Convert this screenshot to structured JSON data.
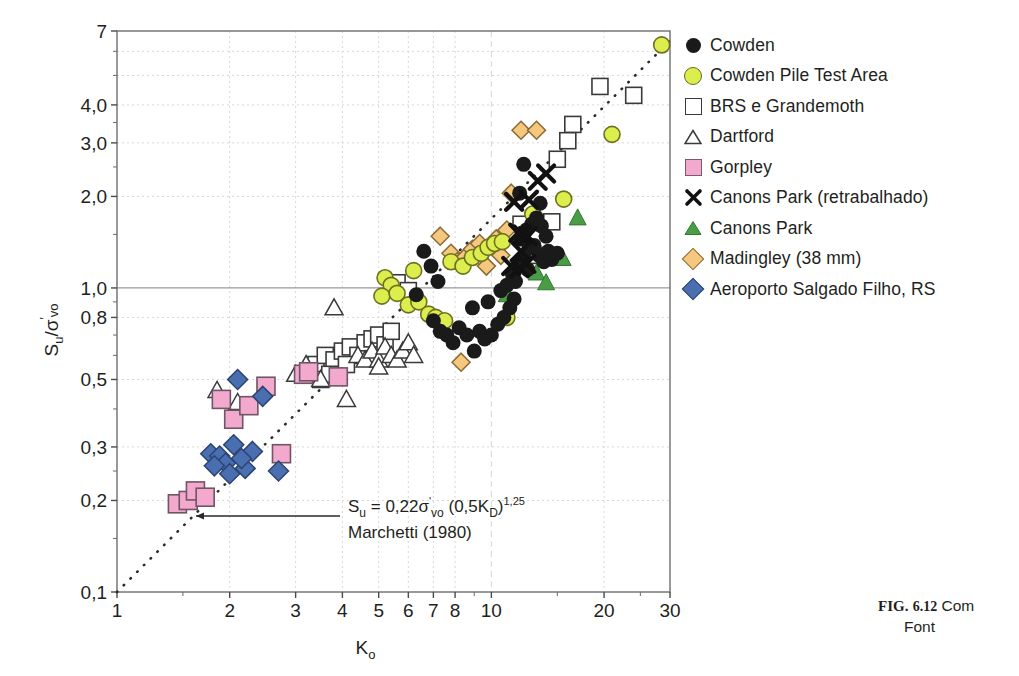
{
  "figure": {
    "caption_line1": "FIG. 6.12 Com",
    "caption_line2": "Font",
    "caption_label": "FIG.",
    "caption_number": "6.12"
  },
  "axes": {
    "ylabel": "S",
    "ylabel_sub": "u",
    "ylabel_den": "σ",
    "ylabel_den_sub": "vo",
    "ylabel_full": "Su/σ'vo",
    "xlabel": "K",
    "xlabel_sub": "o",
    "xlabel_full": "Ko",
    "x_ticks": [
      "1",
      "2",
      "3",
      "4",
      "5",
      "6",
      "7",
      "8",
      "10",
      "20",
      "30"
    ],
    "x_tick_values": [
      1,
      2,
      3,
      4,
      5,
      6,
      7,
      8,
      10,
      20,
      30
    ],
    "y_ticks": [
      "0,1",
      "0,2",
      "0,3",
      "0,5",
      "0,8",
      "1,0",
      "2,0",
      "3,0",
      "4,0",
      "7"
    ],
    "y_tick_values": [
      0.1,
      0.2,
      0.3,
      0.5,
      0.8,
      1.0,
      2.0,
      3.0,
      4.0,
      7.0
    ],
    "xlim": [
      1,
      30
    ],
    "ylim": [
      0.1,
      7
    ],
    "xscale": "log",
    "yscale": "log",
    "grid": true
  },
  "annotation": {
    "equation": "Su = 0,22σ'vo (0,5KD)1,25",
    "eq_s": "S",
    "eq_s_sub": "u",
    "eq_mid": " = 0,22σ",
    "eq_prime": "'",
    "eq_vo": "vo",
    "eq_paren": " (0,5K",
    "eq_kd": "D",
    "eq_close": ")",
    "eq_exp": "1,25",
    "reference": "Marchetti (1980)"
  },
  "legend": {
    "items": [
      {
        "label": "Cowden",
        "marker": "circle-black",
        "color": "#1a1a1a"
      },
      {
        "label": "Cowden Pile Test Area",
        "marker": "circle-yellow",
        "color": "#dced4e"
      },
      {
        "label": "BRS e Grandemoth",
        "marker": "square-white",
        "color": "#ffffff"
      },
      {
        "label": "Dartford",
        "marker": "triangle-white",
        "color": "#ffffff"
      },
      {
        "label": "Gorpley",
        "marker": "square-pink",
        "color": "#f3a9cd"
      },
      {
        "label": "Canons Park (retrabalhado)",
        "marker": "x-black",
        "color": "#111111"
      },
      {
        "label": "Canons Park",
        "marker": "triangle-green",
        "color": "#4a9c46"
      },
      {
        "label": "Madingley (38 mm)",
        "marker": "diamond-orange",
        "color": "#f6c87f"
      },
      {
        "label": "Aeroporto Salgado Filho, RS",
        "marker": "diamond-blue",
        "color": "#4a6fb0"
      }
    ]
  },
  "chart_data": {
    "type": "scatter",
    "title": "",
    "xlabel": "Ko",
    "ylabel": "Su/σ'vo",
    "xscale": "log",
    "yscale": "log",
    "xlim": [
      1,
      30
    ],
    "ylim": [
      0.1,
      7
    ],
    "grid": true,
    "legend_position": "right",
    "trendline": {
      "label": "Su = 0,22σ'vo (0,5KD)1,25",
      "style": "dotted",
      "points": [
        [
          1,
          0.1
        ],
        [
          30,
          6.5
        ]
      ]
    },
    "reference_line_y": 1.0,
    "series": [
      {
        "name": "Cowden",
        "marker": "circle-black",
        "color": "#1a1a1a",
        "points": [
          [
            6.6,
            1.32
          ],
          [
            6.9,
            1.18
          ],
          [
            7.2,
            1.05
          ],
          [
            6.3,
            0.95
          ],
          [
            7.0,
            0.78
          ],
          [
            7.3,
            0.72
          ],
          [
            7.6,
            0.7
          ],
          [
            7.9,
            0.66
          ],
          [
            8.2,
            0.74
          ],
          [
            8.6,
            0.7
          ],
          [
            9.0,
            0.62
          ],
          [
            9.3,
            0.72
          ],
          [
            9.6,
            0.68
          ],
          [
            10.0,
            0.7
          ],
          [
            10.4,
            0.76
          ],
          [
            10.8,
            0.8
          ],
          [
            11.2,
            0.86
          ],
          [
            11.5,
            0.92
          ],
          [
            11.0,
            1.02
          ],
          [
            11.4,
            1.1
          ],
          [
            11.8,
            1.18
          ],
          [
            12.2,
            1.26
          ],
          [
            12.6,
            1.35
          ],
          [
            12.0,
            1.45
          ],
          [
            12.4,
            1.55
          ],
          [
            12.8,
            1.62
          ],
          [
            13.2,
            1.7
          ],
          [
            13.6,
            1.6
          ],
          [
            14.0,
            1.48
          ],
          [
            13.0,
            1.38
          ],
          [
            13.4,
            1.28
          ],
          [
            14.2,
            1.32
          ],
          [
            13.8,
            1.22
          ],
          [
            12.5,
            1.15
          ],
          [
            11.9,
            2.05
          ],
          [
            12.2,
            2.55
          ],
          [
            13.5,
            1.9
          ],
          [
            14.5,
            1.24
          ],
          [
            15.0,
            1.3
          ],
          [
            11.6,
            1.05
          ],
          [
            10.6,
            0.98
          ],
          [
            9.8,
            0.9
          ],
          [
            8.9,
            0.86
          ]
        ]
      },
      {
        "name": "Cowden Pile Test Area",
        "marker": "circle-yellow",
        "color": "#dced4e",
        "points": [
          [
            5.2,
            1.08
          ],
          [
            5.4,
            1.02
          ],
          [
            5.1,
            0.94
          ],
          [
            5.6,
            0.96
          ],
          [
            6.0,
            0.88
          ],
          [
            6.4,
            0.9
          ],
          [
            6.8,
            0.82
          ],
          [
            7.1,
            0.8
          ],
          [
            7.5,
            0.78
          ],
          [
            6.2,
            1.14
          ],
          [
            7.8,
            1.22
          ],
          [
            8.4,
            1.18
          ],
          [
            8.9,
            1.26
          ],
          [
            9.4,
            1.3
          ],
          [
            9.8,
            1.36
          ],
          [
            10.2,
            1.4
          ],
          [
            11.0,
            0.8
          ],
          [
            12.9,
            1.75
          ],
          [
            15.6,
            1.96
          ],
          [
            21.0,
            3.2
          ],
          [
            28.5,
            6.3
          ],
          [
            10.7,
            1.42
          ]
        ]
      },
      {
        "name": "BRS e Grandemoth",
        "marker": "square-white",
        "color": "#ffffff",
        "points": [
          [
            3.4,
            0.56
          ],
          [
            3.6,
            0.6
          ],
          [
            3.8,
            0.58
          ],
          [
            4.0,
            0.62
          ],
          [
            4.2,
            0.64
          ],
          [
            4.4,
            0.6
          ],
          [
            4.6,
            0.66
          ],
          [
            4.8,
            0.68
          ],
          [
            5.0,
            0.7
          ],
          [
            5.2,
            0.65
          ],
          [
            5.4,
            0.72
          ],
          [
            3.5,
            0.5
          ],
          [
            3.7,
            0.52
          ],
          [
            4.1,
            0.56
          ],
          [
            5.6,
            1.04
          ],
          [
            6.0,
            0.98
          ],
          [
            12.0,
            1.62
          ],
          [
            13.0,
            1.28
          ],
          [
            14.5,
            1.65
          ],
          [
            15.0,
            2.65
          ],
          [
            16.5,
            3.45
          ],
          [
            16.0,
            3.05
          ],
          [
            19.5,
            4.6
          ],
          [
            24.0,
            4.3
          ]
        ]
      },
      {
        "name": "Dartford",
        "marker": "triangle-white",
        "color": "#ffffff",
        "points": [
          [
            1.85,
            0.46
          ],
          [
            2.1,
            0.42
          ],
          [
            3.0,
            0.52
          ],
          [
            3.2,
            0.56
          ],
          [
            3.5,
            0.5
          ],
          [
            3.8,
            0.86
          ],
          [
            4.1,
            0.43
          ],
          [
            4.4,
            0.6
          ],
          [
            4.6,
            0.58
          ],
          [
            4.8,
            0.62
          ],
          [
            5.0,
            0.58
          ],
          [
            5.2,
            0.64
          ],
          [
            5.4,
            0.6
          ],
          [
            5.0,
            0.55
          ],
          [
            5.6,
            0.58
          ],
          [
            5.8,
            0.62
          ],
          [
            6.0,
            0.66
          ],
          [
            6.2,
            0.6
          ]
        ]
      },
      {
        "name": "Gorpley",
        "marker": "square-pink",
        "color": "#f3a9cd",
        "points": [
          [
            1.45,
            0.195
          ],
          [
            1.55,
            0.2
          ],
          [
            1.62,
            0.215
          ],
          [
            1.72,
            0.205
          ],
          [
            1.9,
            0.43
          ],
          [
            2.05,
            0.37
          ],
          [
            2.25,
            0.41
          ],
          [
            2.5,
            0.475
          ],
          [
            2.75,
            0.285
          ],
          [
            3.15,
            0.52
          ],
          [
            3.25,
            0.53
          ],
          [
            3.9,
            0.51
          ]
        ]
      },
      {
        "name": "Canons Park (retrabalhado)",
        "marker": "x-black",
        "color": "#111111",
        "points": [
          [
            11.5,
            1.92
          ],
          [
            12.6,
            1.95
          ],
          [
            13.3,
            2.25
          ],
          [
            11.8,
            1.52
          ],
          [
            12.1,
            1.5
          ],
          [
            12.5,
            1.48
          ],
          [
            12.0,
            1.32
          ],
          [
            14.0,
            2.38
          ],
          [
            11.3,
            1.18
          ],
          [
            11.9,
            1.16
          ],
          [
            12.4,
            1.2
          ]
        ]
      },
      {
        "name": "Canons Park",
        "marker": "triangle-green",
        "color": "#4a9c46",
        "points": [
          [
            13.2,
            1.12
          ],
          [
            14.0,
            1.04
          ],
          [
            15.5,
            1.25
          ],
          [
            17.0,
            1.7
          ],
          [
            11.0,
            0.95
          ]
        ]
      },
      {
        "name": "Madingley (38 mm)",
        "marker": "diamond-orange",
        "color": "#f6c87f",
        "points": [
          [
            7.3,
            1.48
          ],
          [
            7.8,
            1.3
          ],
          [
            8.1,
            1.22
          ],
          [
            8.5,
            1.26
          ],
          [
            8.9,
            1.34
          ],
          [
            9.3,
            1.4
          ],
          [
            8.3,
            0.57
          ],
          [
            10.3,
            1.45
          ],
          [
            11.0,
            1.55
          ],
          [
            10.6,
            1.28
          ],
          [
            12.0,
            3.3
          ],
          [
            13.2,
            3.3
          ],
          [
            11.3,
            2.05
          ],
          [
            9.7,
            1.18
          ]
        ]
      },
      {
        "name": "Aeroporto Salgado Filho, RS",
        "marker": "diamond-blue",
        "color": "#4a6fb0",
        "points": [
          [
            1.78,
            0.285
          ],
          [
            1.88,
            0.28
          ],
          [
            1.95,
            0.265
          ],
          [
            2.0,
            0.245
          ],
          [
            2.1,
            0.5
          ],
          [
            2.05,
            0.305
          ],
          [
            2.2,
            0.255
          ],
          [
            2.3,
            0.29
          ],
          [
            2.45,
            0.44
          ],
          [
            2.7,
            0.25
          ],
          [
            1.82,
            0.26
          ],
          [
            2.15,
            0.275
          ]
        ]
      }
    ]
  }
}
